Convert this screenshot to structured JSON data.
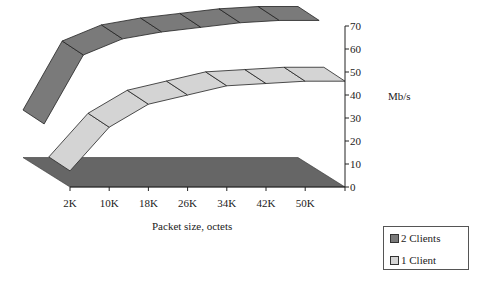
{
  "chart_data": {
    "type": "line",
    "style": "3d-ribbon",
    "title": "",
    "xlabel": "Packet size, octets",
    "ylabel": "Mb/s",
    "categories": [
      "2K",
      "10K",
      "18K",
      "26K",
      "34K",
      "42K",
      "50K"
    ],
    "y_ticks": [
      "0",
      "10",
      "20",
      "30",
      "40",
      "50",
      "60",
      "70"
    ],
    "ylim": [
      0,
      70
    ],
    "grid": false,
    "legend_position": "bottom-right",
    "series": [
      {
        "name": "2 Clients",
        "color": "#7a7a7a",
        "values": [
          20,
          50,
          57,
          60,
          62,
          64,
          65
        ]
      },
      {
        "name": "1 Client",
        "color": "#d4d4d4",
        "values": [
          7,
          26,
          36,
          40,
          44,
          45,
          46
        ]
      }
    ],
    "floor_color": "#666666"
  },
  "axes": {
    "x_title": "Packet size, octets",
    "y_title": "Mb/s"
  },
  "legend": {
    "items": [
      {
        "label": "2 Clients",
        "color": "#7a7a7a"
      },
      {
        "label": "1 Client",
        "color": "#d4d4d4"
      }
    ]
  }
}
